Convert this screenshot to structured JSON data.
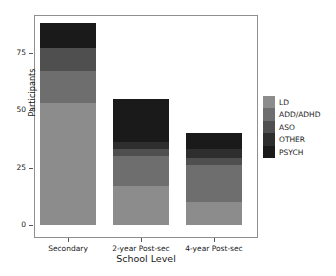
{
  "chart_data": {
    "type": "bar",
    "barmode": "stacked",
    "title": "",
    "xlabel": "School Level",
    "ylabel": "Participants",
    "categories": [
      "Secondary",
      "2-year Post-sec",
      "4-year Post-sec"
    ],
    "ylim": [
      0,
      92
    ],
    "yticks": [
      0,
      25,
      50,
      75
    ],
    "ytick_labels": [
      "0",
      "25",
      "50",
      "75"
    ],
    "grid": false,
    "legend_position": "right",
    "series": [
      {
        "name": "LD",
        "color": "#8c8c8c",
        "values": [
          53,
          17,
          10
        ]
      },
      {
        "name": "ADD/ADHD",
        "color": "#6e6e6e",
        "values": [
          14,
          13,
          16
        ]
      },
      {
        "name": "ASO",
        "color": "#4f4f4f",
        "values": [
          10,
          3,
          3
        ]
      },
      {
        "name": "OTHER",
        "color": "#2e2e2e",
        "values": [
          0,
          3,
          4
        ]
      },
      {
        "name": "PSYCH",
        "color": "#1a1a1a",
        "values": [
          11,
          19,
          7
        ]
      }
    ],
    "totals": [
      88,
      55,
      40
    ]
  },
  "axes": {
    "y_label": "Participants",
    "x_label": "School Level",
    "y_ticks": [
      "0",
      "25",
      "50",
      "75"
    ],
    "x_ticks": [
      "Secondary",
      "2-year Post-sec",
      "4-year Post-sec"
    ]
  },
  "legend": {
    "items": [
      {
        "label": "LD",
        "color": "#8c8c8c"
      },
      {
        "label": "ADD/ADHD",
        "color": "#6e6e6e"
      },
      {
        "label": "ASO",
        "color": "#4f4f4f"
      },
      {
        "label": "OTHER",
        "color": "#2e2e2e"
      },
      {
        "label": "PSYCH",
        "color": "#1a1a1a"
      }
    ]
  }
}
